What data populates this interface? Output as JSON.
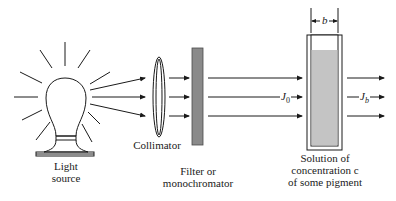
{
  "diagram": {
    "components": {
      "light_source": {
        "label_line1": "Light",
        "label_line2": "source"
      },
      "collimator": {
        "label": "Collimator"
      },
      "filter": {
        "label_line1": "Filter or",
        "label_line2": "monochromator"
      },
      "cuvette": {
        "label_line1": "Solution of",
        "label_line2": "concentration c",
        "label_line3": "of some pigment",
        "width_symbol": "b"
      }
    },
    "beams": {
      "incident": {
        "symbol": "J",
        "subscript": "0"
      },
      "transmitted": {
        "symbol": "J",
        "subscript": "b"
      }
    },
    "colors": {
      "line": "#1a1a1a",
      "filter_fill": "#8a8a8a",
      "solution_fill": "#c4c4c4"
    }
  }
}
